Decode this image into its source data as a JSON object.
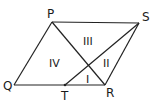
{
  "diagram": {
    "type": "parallelogram with diagonal and segment",
    "points": {
      "P": {
        "label": "P",
        "x": 52,
        "y": 22,
        "lx": 47,
        "ly": 18
      },
      "S": {
        "label": "S",
        "x": 139,
        "y": 23,
        "lx": 142,
        "ly": 21
      },
      "Q": {
        "label": "Q",
        "x": 14,
        "y": 85,
        "lx": 3,
        "ly": 90
      },
      "R": {
        "label": "R",
        "x": 105,
        "y": 85,
        "lx": 106,
        "ly": 97
      },
      "T": {
        "label": "T",
        "x": 65,
        "y": 85,
        "lx": 61,
        "ly": 100
      }
    },
    "segments": [
      {
        "from": "P",
        "to": "S"
      },
      {
        "from": "S",
        "to": "R"
      },
      {
        "from": "R",
        "to": "Q"
      },
      {
        "from": "Q",
        "to": "P"
      },
      {
        "from": "P",
        "to": "R"
      },
      {
        "from": "S",
        "to": "T"
      }
    ],
    "regions": [
      {
        "label": "I",
        "x": 86,
        "y": 83
      },
      {
        "label": "II",
        "x": 103,
        "y": 67
      },
      {
        "label": "III",
        "x": 83,
        "y": 45
      },
      {
        "label": "IV",
        "x": 49,
        "y": 67
      }
    ]
  }
}
